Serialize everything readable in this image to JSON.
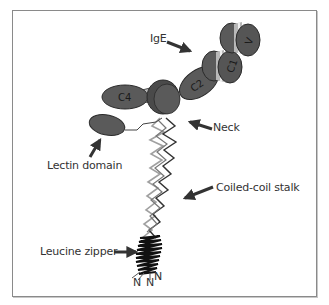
{
  "figure": {
    "labels": {
      "ige": "IgE",
      "neck": "Neck",
      "lectin_domain": "Lectin domain",
      "coiled_coil_stalk": "Coiled-coil stalk",
      "leucine_zipper": "Leucine zipper"
    },
    "domains": {
      "vh": "V",
      "ce1": "C1",
      "ce2": "C2",
      "ce4": "C4"
    },
    "termini": [
      "N",
      "N",
      "N"
    ],
    "colors": {
      "domain_fill": "#5a5a5a",
      "domain_stripe": "#b8b8b8",
      "outline": "#2a2a2a",
      "coil_dark": "#333333",
      "coil_light": "#a0a0a0",
      "frame": "#8a8a8a"
    }
  }
}
